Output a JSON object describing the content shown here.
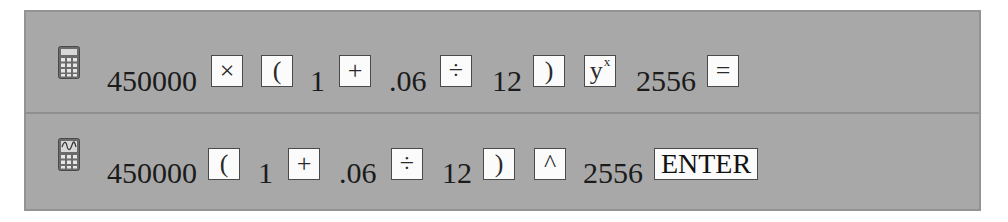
{
  "rows": [
    {
      "device": "scientific-calculator",
      "icon": "calculator-icon",
      "tokens": {
        "principal": "450000",
        "times": "×",
        "open_paren": "(",
        "one": "1",
        "plus": "+",
        "rate": ".06",
        "divide": "÷",
        "months": "12",
        "close_paren": ")",
        "power_base": "y",
        "power_exp": "x",
        "periods": "2556",
        "equals": "="
      }
    },
    {
      "device": "graphing-calculator",
      "icon": "graphing-calculator-icon",
      "tokens": {
        "principal": "450000",
        "open_paren": "(",
        "one": "1",
        "plus": "+",
        "rate": ".06",
        "divide": "÷",
        "months": "12",
        "close_paren": ")",
        "caret": "^",
        "periods": "2556",
        "enter": "ENTER"
      }
    }
  ],
  "colors": {
    "panel_bg": "#a8a8a8",
    "panel_border": "#939393",
    "key_bg": "#fbfbfb",
    "key_border": "#4a4a4a"
  }
}
